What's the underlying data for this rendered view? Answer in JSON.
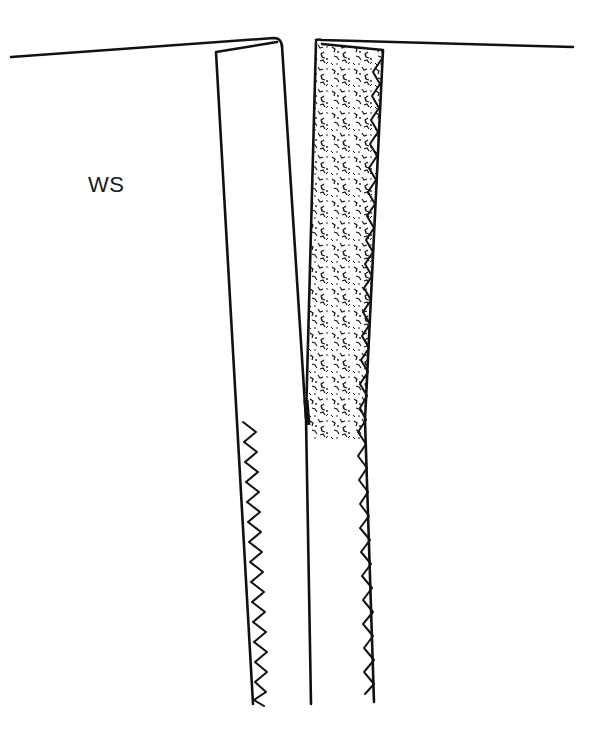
{
  "diagram": {
    "labels": {
      "wrong_side": "WS"
    },
    "parts": {
      "left_garment_edge": "fabric fold line left",
      "right_garment_edge": "fabric fold line right",
      "left_seam_allowance": "plain seam allowance, folded back",
      "right_seam_allowance": "interfaced seam allowance (stippled)",
      "left_zigzag_finish": "zigzag-finished raw edge (left)",
      "right_zigzag_finish": "zigzag-finished raw edge (right)",
      "center_seam": "center seam line"
    },
    "colors": {
      "ink": "#111111",
      "background": "#ffffff",
      "interfacing_fill": "#ffffff"
    }
  }
}
